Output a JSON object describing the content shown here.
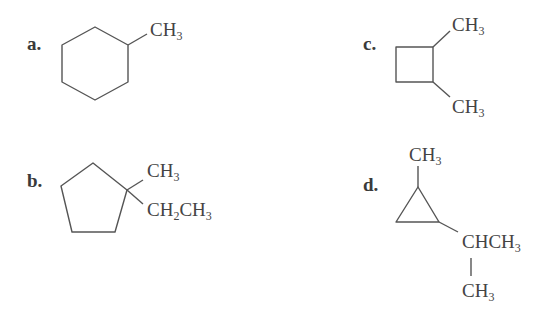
{
  "structures": [
    {
      "label": "a.",
      "ring": "cyclohexane",
      "substituents": [
        {
          "group": "CH",
          "sub": "3"
        }
      ]
    },
    {
      "label": "b.",
      "ring": "cyclopentane",
      "substituents": [
        {
          "group": "CH",
          "sub": "3"
        },
        {
          "group1": "CH",
          "sub1": "2",
          "group2": "CH",
          "sub2": "3"
        }
      ]
    },
    {
      "label": "c.",
      "ring": "cyclobutane",
      "substituents": [
        {
          "group": "CH",
          "sub": "3"
        },
        {
          "group": "CH",
          "sub": "3"
        }
      ]
    },
    {
      "label": "d.",
      "ring": "cyclopropane",
      "substituents": [
        {
          "group": "CH",
          "sub": "3"
        },
        {
          "group": "CHCH",
          "sub": "3"
        },
        {
          "group": "CH",
          "sub": "3"
        }
      ]
    }
  ],
  "colors": {
    "line": "#555555",
    "text": "#444444"
  }
}
